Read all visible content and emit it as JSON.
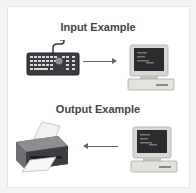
{
  "sections": {
    "input": {
      "title": "Input Example",
      "device_from": "keyboard-icon",
      "device_to": "computer-icon",
      "arrow_direction": "right"
    },
    "output": {
      "title": "Output Example",
      "device_from": "computer-icon",
      "device_to": "printer-icon",
      "arrow_direction": "left"
    }
  },
  "colors": {
    "background": "#f4f4f4",
    "card": "#ffffff",
    "title_text": "#444444",
    "arrow": "#666666"
  }
}
